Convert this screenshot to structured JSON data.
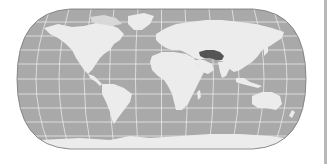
{
  "map": {
    "projection": "robinson-like",
    "highlighted_region": "Iran / Afghanistan area",
    "colors": {
      "ocean": "#a9a9a9",
      "land": "#ececec",
      "highlight": "#555555",
      "graticule": "#f2f2f2",
      "outline": "#777777",
      "edge_line": "#b9b9b9",
      "background": "#ffffff"
    }
  }
}
